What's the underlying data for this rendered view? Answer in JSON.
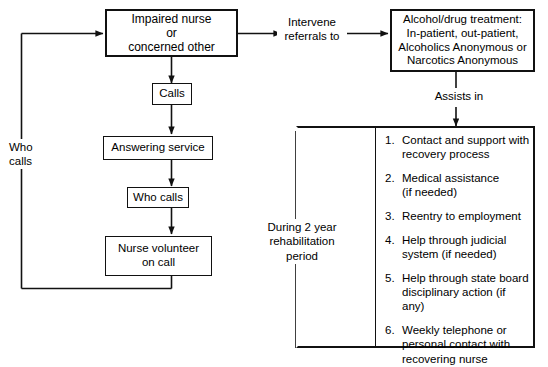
{
  "diagram": {
    "line_color": "#111111",
    "background": "#ffffff"
  },
  "nodes": {
    "impaired_nurse": "Impaired nurse\nor\nconcerned other",
    "calls": "Calls",
    "answering_service": "Answering service",
    "who_calls_box": "Who calls",
    "nurse_volunteer": "Nurse volunteer\non call",
    "treatment": "Alcohol/drug treatment:\nIn-patient, out-patient,\nAlcoholics Anonymous or\nNarcotics Anonymous"
  },
  "edge_labels": {
    "intervene": "Intervene\nreferrals to",
    "assists_in": "Assists in",
    "who_calls_loop": "Who\ncalls"
  },
  "panel": {
    "period_label": "During 2 year\nrehabilitation\nperiod",
    "outcomes": [
      {
        "number": "1.",
        "text": "Contact and support with\nrecovery process"
      },
      {
        "number": "2.",
        "text": "Medical assistance\n(if needed)"
      },
      {
        "number": "3.",
        "text": "Reentry to employment"
      },
      {
        "number": "4.",
        "text": "Help through  judicial\nsystem  (if needed)"
      },
      {
        "number": "5.",
        "text": "Help through state board\ndisciplinary action (if any)"
      },
      {
        "number": "6.",
        "text": "Weekly telephone or\npersonal contact with\nrecovering nurse"
      }
    ]
  }
}
